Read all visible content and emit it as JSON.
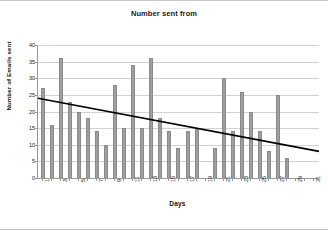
{
  "chart_data": {
    "type": "bar",
    "title": "Number sent from",
    "xlabel": "Days",
    "ylabel": "Number of Emails sent",
    "ylim": [
      0,
      40
    ],
    "ytick_step": 5,
    "yticks": [
      0,
      5,
      10,
      15,
      20,
      25,
      30,
      35,
      40
    ],
    "grid": true,
    "legend": false,
    "legend_position": "none",
    "bar_color": "#9e9e9e",
    "trendline_color": "#000000",
    "categories": [
      1,
      2,
      3,
      4,
      5,
      6,
      7,
      8,
      9,
      10,
      11,
      12,
      13,
      14,
      15,
      16,
      17,
      18,
      19,
      20,
      21,
      22,
      23,
      24,
      25,
      26,
      27,
      28,
      29,
      30,
      31
    ],
    "xtick_labels": [
      "1",
      "",
      "3",
      "",
      "5",
      "",
      "7",
      "",
      "9",
      "",
      "11",
      "",
      "13",
      "",
      "15",
      "",
      "17",
      "",
      "19",
      "",
      "21",
      "",
      "23",
      "",
      "25",
      "",
      "27",
      "",
      "29",
      "",
      "31"
    ],
    "values": [
      27,
      16,
      36,
      23,
      20,
      18,
      14,
      10,
      28,
      15,
      34,
      15,
      36,
      18,
      14,
      9,
      14,
      15,
      0,
      9,
      30,
      14,
      26,
      20,
      14,
      8,
      25,
      6,
      0,
      0,
      0
    ],
    "annotations": [
      {
        "type": "trendline",
        "kind": "linear",
        "y_start": 24,
        "y_end": 8,
        "x_start": 1,
        "x_end": 31
      }
    ]
  }
}
